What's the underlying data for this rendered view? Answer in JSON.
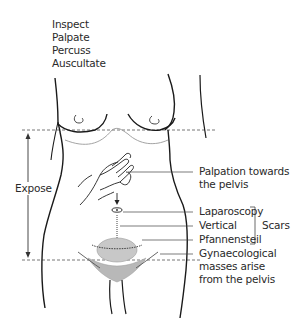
{
  "diagram": {
    "steps": [
      "Inspect",
      "Palpate",
      "Percuss",
      "Auscultate"
    ],
    "expose_label": "Expose",
    "palpation_label": [
      "Palpation towards",
      "the pelvis"
    ],
    "scars": {
      "group_label": "Scars",
      "items": [
        "Laparoscopy",
        "Vertical",
        "Pfannensteil"
      ]
    },
    "masses_label": [
      "Gynaecological",
      "masses arise",
      "from the pelvis"
    ],
    "colors": {
      "outline": "#1a1a1a",
      "dashed_line": "#777777",
      "mass_fill": "#c8c8c8",
      "hair_fill": "#b0b0b0"
    }
  }
}
